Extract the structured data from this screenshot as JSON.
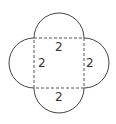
{
  "diagram": {
    "square": {
      "side_label": "2",
      "edge_style": "dashed"
    },
    "labels": {
      "top": "2",
      "left": "2",
      "right": "2",
      "bottom": "2"
    },
    "colors": {
      "stroke": "#444444",
      "text": "#333333",
      "background": "#ffffff"
    }
  }
}
